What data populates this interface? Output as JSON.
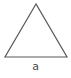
{
  "figure": {
    "name": "triangle-diagram",
    "background_color": "#ffffff",
    "shape": {
      "type": "triangle",
      "variant": "isosceles",
      "stroke_color": "#585858",
      "stroke_width": 1.2,
      "fill": "none",
      "vertices": [
        {
          "x": 36,
          "y": 4
        },
        {
          "x": 5,
          "y": 57
        },
        {
          "x": 67,
          "y": 57
        }
      ],
      "base_length_px": 62,
      "height_px": 53
    },
    "label": {
      "text": "a",
      "color": "#4a4a4a",
      "font_size_px": 11,
      "position": {
        "x": 36,
        "y": 67
      },
      "describes": "base-side-length"
    }
  }
}
